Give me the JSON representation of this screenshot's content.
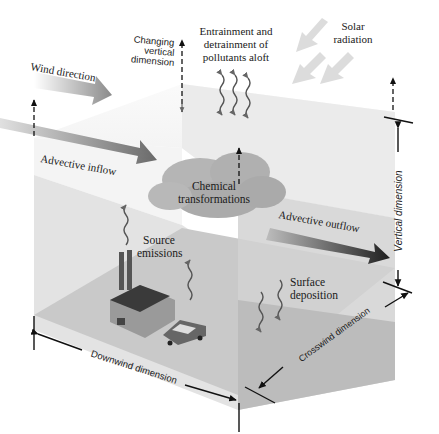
{
  "diagram": {
    "labels": {
      "wind_direction": "Wind direction",
      "changing_vertical_1": "Changing",
      "changing_vertical_2": "vertical",
      "changing_vertical_3": "dimension",
      "entrainment_1": "Entrainment and",
      "entrainment_2": "detrainment of",
      "entrainment_3": "pollutants aloft",
      "solar_1": "Solar",
      "solar_2": "radiation",
      "advective_inflow": "Advective inflow",
      "chemical_1": "Chemical",
      "chemical_2": "transformations",
      "source_1": "Source",
      "source_2": "emissions",
      "advective_outflow": "Advective outflow",
      "surface_1": "Surface",
      "surface_2": "deposition",
      "vertical_dimension": "Vertical dimension",
      "downwind_dimension": "Downwind dimension",
      "crosswind_dimension": "Crosswind dimension"
    },
    "colors": {
      "box_top": "#f2f2f2",
      "box_front": "#dcdcdc",
      "box_right": "#cfcfcf",
      "box_floor": "#c4c4c4",
      "cloud": "#a9a9a9",
      "arrow_dark": "#2a2a2a",
      "arrow_mid": "#7a7a7a",
      "arrow_light": "#d8d8d8"
    }
  }
}
